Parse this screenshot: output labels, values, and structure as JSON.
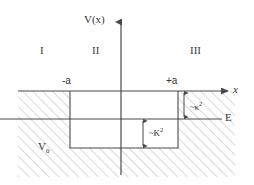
{
  "figure": {
    "axes": {
      "vertical_label": "V(x)",
      "horizontal_label": "x"
    },
    "regions": [
      {
        "id": "I",
        "label": "I"
      },
      {
        "id": "II",
        "label": "II"
      },
      {
        "id": "III",
        "label": "III"
      }
    ],
    "boundaries": {
      "left_label": "-a",
      "right_label": "+a"
    },
    "energy": {
      "label": "E"
    },
    "well_depth": {
      "label": "V",
      "subscript": "0"
    },
    "annotations": [
      {
        "id": "outside-decay",
        "tilde": "~",
        "symbol": "κ",
        "exponent": "2"
      },
      {
        "id": "inside-wave",
        "tilde": "~",
        "symbol": "K",
        "exponent": "2"
      }
    ],
    "colors": {
      "line": "#4a4a4a",
      "hatch": "#b9b9b9",
      "text": "#333333",
      "background": "#ffffff",
      "well_interior": "#ffffff"
    }
  }
}
